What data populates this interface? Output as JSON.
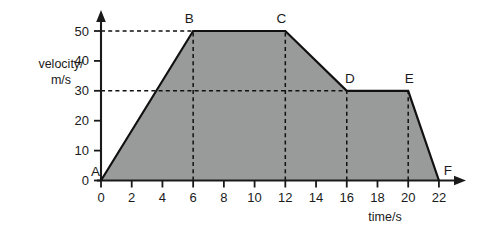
{
  "chart_data": {
    "type": "line",
    "title": "",
    "xlabel": "time/s",
    "ylabel": "velocity/ m/s",
    "ylabel_lines": [
      "velocity/",
      "m/s"
    ],
    "xlim": [
      0,
      22
    ],
    "ylim": [
      0,
      50
    ],
    "xticks": [
      0,
      2,
      4,
      6,
      8,
      10,
      12,
      14,
      16,
      18,
      20,
      22
    ],
    "xticklabels": [
      "0",
      "2",
      "4",
      "6",
      "8",
      "10",
      "12",
      "14",
      "16",
      "18",
      "20",
      "22"
    ],
    "yticks": [
      0,
      10,
      20,
      30,
      40,
      50
    ],
    "yticklabels": [
      "0",
      "10",
      "20",
      "30",
      "40",
      "50"
    ],
    "grid": false,
    "legend": false,
    "fill_under": true,
    "fill_color": "#999a9a",
    "line_color": "#111111",
    "series": [
      {
        "name": "velocity",
        "x": [
          0,
          6,
          12,
          16,
          20,
          22
        ],
        "values": [
          0,
          50,
          50,
          30,
          30,
          0
        ]
      }
    ],
    "points": [
      {
        "label": "A",
        "x": 0,
        "y": 0
      },
      {
        "label": "B",
        "x": 6,
        "y": 50
      },
      {
        "label": "C",
        "x": 12,
        "y": 50
      },
      {
        "label": "D",
        "x": 16,
        "y": 30
      },
      {
        "label": "E",
        "x": 20,
        "y": 30
      },
      {
        "label": "F",
        "x": 22,
        "y": 0
      }
    ],
    "guides": {
      "horizontal": [
        {
          "value": 50,
          "from_x": 0,
          "to_x": 6
        },
        {
          "value": 30,
          "from_x": 0,
          "to_x": 20
        }
      ],
      "vertical": [
        {
          "value": 6,
          "from_y": 0,
          "to_y": 50
        },
        {
          "value": 12,
          "from_y": 0,
          "to_y": 50
        },
        {
          "value": 16,
          "from_y": 0,
          "to_y": 30
        },
        {
          "value": 20,
          "from_y": 0,
          "to_y": 30
        }
      ]
    }
  }
}
